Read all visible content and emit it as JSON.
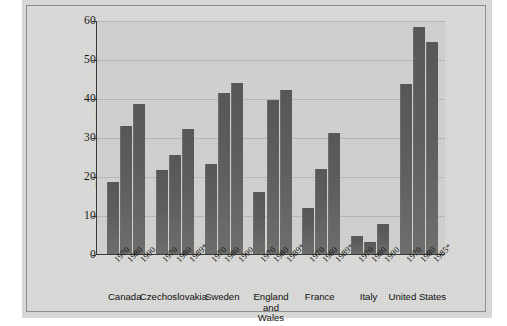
{
  "chart_data": {
    "type": "bar",
    "title": "",
    "xlabel": "",
    "ylabel": "Divorces per 100 marriages",
    "ylim": [
      0,
      60
    ],
    "ytick_labels": [
      "0",
      "10",
      "20",
      "30",
      "40",
      "50",
      "60"
    ],
    "ytick_values": [
      0,
      10,
      20,
      30,
      40,
      50,
      60
    ],
    "grid": true,
    "legend": "none",
    "categories": [
      "Canada",
      "Czechoslovakia",
      "Sweden",
      "England and Wales",
      "France",
      "Italy",
      "United States"
    ],
    "groups": [
      {
        "country": "Canada",
        "country_lines": [
          "Canada"
        ],
        "bars": [
          {
            "year": "1970",
            "value": 18.8
          },
          {
            "year": "1980",
            "value": 33.2
          },
          {
            "year": "1990",
            "value": 38.7
          }
        ]
      },
      {
        "country": "Czechoslovakia",
        "country_lines": [
          "Czechoslovakia"
        ],
        "bars": [
          {
            "year": "1970",
            "value": 21.9
          },
          {
            "year": "1980",
            "value": 25.7
          },
          {
            "year": "1989*",
            "value": 32.3
          }
        ]
      },
      {
        "country": "Sweden",
        "country_lines": [
          "Sweden"
        ],
        "bars": [
          {
            "year": "1970",
            "value": 23.4
          },
          {
            "year": "1980",
            "value": 41.6
          },
          {
            "year": "1990",
            "value": 44.1
          }
        ]
      },
      {
        "country": "England and Wales",
        "country_lines": [
          "England",
          "and",
          "Wales"
        ],
        "bars": [
          {
            "year": "1970",
            "value": 16.2
          },
          {
            "year": "1980",
            "value": 39.8
          },
          {
            "year": "1989*",
            "value": 42.2
          }
        ]
      },
      {
        "country": "France",
        "country_lines": [
          "France"
        ],
        "bars": [
          {
            "year": "1970",
            "value": 12.1
          },
          {
            "year": "1980",
            "value": 22.1
          },
          {
            "year": "1989*",
            "value": 31.2
          }
        ]
      },
      {
        "country": "Italy",
        "country_lines": [
          "Italy"
        ],
        "bars": [
          {
            "year": "1970",
            "value": 5.0
          },
          {
            "year": "1980",
            "value": 3.3
          },
          {
            "year": "1990",
            "value": 8.0
          }
        ]
      },
      {
        "country": "United States",
        "country_lines": [
          "United States"
        ],
        "bars": [
          {
            "year": "1970",
            "value": 43.8
          },
          {
            "year": "1980",
            "value": 58.4
          },
          {
            "year": "1985*",
            "value": 54.7
          }
        ]
      }
    ],
    "colors": {
      "bar": "#5e5e5e",
      "plot_background": "#cfcfcd",
      "page_background": "#d8d8d6",
      "gridline": "#b6b6b4",
      "axis": "#3a3a3a",
      "text": "#121212"
    }
  }
}
